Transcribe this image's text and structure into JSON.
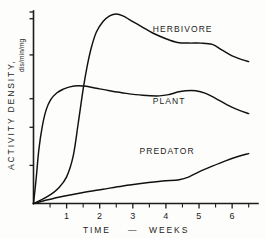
{
  "chart_data": {
    "type": "line",
    "title": "",
    "subtitle": "",
    "xlabel": "TIME",
    "xlabel_separator": "—",
    "xlabel_unit": "WEEKS",
    "ylabel": "ACTIVITY DENSITY,",
    "ylabel_units": "dis/min/mg",
    "grid": false,
    "legend_position": "inline-annotations",
    "xlim": [
      0,
      6.6
    ],
    "ylim": [
      0,
      1.0
    ],
    "x_ticks_major": [
      1,
      2,
      3,
      4,
      5,
      6
    ],
    "x_ticks_major_labels": [
      "1",
      "2",
      "3",
      "4",
      "5",
      "6"
    ],
    "x_ticks_minor": [
      0.5,
      1.5,
      2.5,
      3.5,
      4.5,
      5.5,
      6.5
    ],
    "y_ticks_major": [
      0.2,
      0.4,
      0.55,
      0.78,
      0.97
    ],
    "y_tick_labels": [],
    "y_axis_numeric_labels_shown": false,
    "annotations": [
      {
        "text": "HERBIVORE",
        "x": 3.6,
        "y": 0.9
      },
      {
        "text": "PLANT",
        "x": 3.6,
        "y": 0.52
      },
      {
        "text": "PREDATOR",
        "x": 3.2,
        "y": 0.26
      }
    ],
    "series": [
      {
        "name": "HERBIVORE",
        "label": "HERBIVORE",
        "color": "#111111",
        "points": [
          [
            0.0,
            0.0
          ],
          [
            0.25,
            0.02
          ],
          [
            0.5,
            0.045
          ],
          [
            0.75,
            0.08
          ],
          [
            1.0,
            0.14
          ],
          [
            1.2,
            0.25
          ],
          [
            1.35,
            0.42
          ],
          [
            1.5,
            0.6
          ],
          [
            1.62,
            0.72
          ],
          [
            1.75,
            0.82
          ],
          [
            1.9,
            0.9
          ],
          [
            2.1,
            0.955
          ],
          [
            2.3,
            0.985
          ],
          [
            2.5,
            0.995
          ],
          [
            2.7,
            0.985
          ],
          [
            3.0,
            0.955
          ],
          [
            3.3,
            0.925
          ],
          [
            3.6,
            0.895
          ],
          [
            4.0,
            0.865
          ],
          [
            4.35,
            0.845
          ],
          [
            4.7,
            0.842
          ],
          [
            5.05,
            0.842
          ],
          [
            5.4,
            0.835
          ],
          [
            5.7,
            0.805
          ],
          [
            6.0,
            0.775
          ],
          [
            6.3,
            0.755
          ],
          [
            6.5,
            0.745
          ]
        ]
      },
      {
        "name": "PLANT",
        "label": "PLANT",
        "color": "#111111",
        "points": [
          [
            0.0,
            0.0
          ],
          [
            0.08,
            0.13
          ],
          [
            0.16,
            0.28
          ],
          [
            0.26,
            0.4
          ],
          [
            0.38,
            0.49
          ],
          [
            0.52,
            0.545
          ],
          [
            0.7,
            0.58
          ],
          [
            0.9,
            0.6
          ],
          [
            1.1,
            0.612
          ],
          [
            1.35,
            0.618
          ],
          [
            1.6,
            0.615
          ],
          [
            1.9,
            0.605
          ],
          [
            2.3,
            0.592
          ],
          [
            2.8,
            0.578
          ],
          [
            3.3,
            0.568
          ],
          [
            3.8,
            0.565
          ],
          [
            4.1,
            0.572
          ],
          [
            4.35,
            0.585
          ],
          [
            4.6,
            0.592
          ],
          [
            4.9,
            0.592
          ],
          [
            5.2,
            0.578
          ],
          [
            5.5,
            0.552
          ],
          [
            5.85,
            0.518
          ],
          [
            6.2,
            0.49
          ],
          [
            6.5,
            0.472
          ]
        ]
      },
      {
        "name": "PREDATOR",
        "label": "PREDATOR",
        "color": "#111111",
        "points": [
          [
            0.0,
            0.0
          ],
          [
            0.4,
            0.018
          ],
          [
            0.9,
            0.038
          ],
          [
            1.5,
            0.058
          ],
          [
            2.1,
            0.075
          ],
          [
            2.7,
            0.092
          ],
          [
            3.3,
            0.106
          ],
          [
            3.9,
            0.118
          ],
          [
            4.4,
            0.125
          ],
          [
            4.7,
            0.14
          ],
          [
            5.0,
            0.166
          ],
          [
            5.4,
            0.196
          ],
          [
            5.8,
            0.224
          ],
          [
            6.2,
            0.248
          ],
          [
            6.5,
            0.262
          ]
        ]
      }
    ]
  }
}
